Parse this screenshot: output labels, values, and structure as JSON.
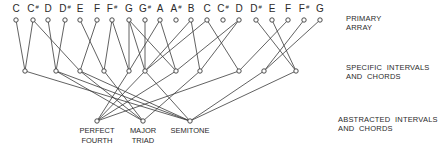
{
  "rows": {
    "primary": {
      "label": "PRIMARY\nARRAY"
    },
    "specific": {
      "label": "SPECIFIC  INTERVALS\nAND  CHORDS"
    },
    "abstracted": {
      "label": "ABSTRACTED  INTERVALS\nAND  CHORDS"
    }
  },
  "primary_notes": [
    {
      "name": "C",
      "accidental": "",
      "x": 16
    },
    {
      "name": "C",
      "accidental": "#",
      "x": 33
    },
    {
      "name": "D",
      "accidental": "",
      "x": 48
    },
    {
      "name": "D",
      "accidental": "#",
      "x": 65
    },
    {
      "name": "E",
      "accidental": "",
      "x": 80
    },
    {
      "name": "F",
      "accidental": "",
      "x": 97
    },
    {
      "name": "F",
      "accidental": "#",
      "x": 112
    },
    {
      "name": "G",
      "accidental": "",
      "x": 129
    },
    {
      "name": "G",
      "accidental": "#",
      "x": 145
    },
    {
      "name": "A",
      "accidental": "",
      "x": 160
    },
    {
      "name": "A",
      "accidental": "#",
      "x": 176
    },
    {
      "name": "B",
      "accidental": "",
      "x": 191
    },
    {
      "name": "C",
      "accidental": "",
      "x": 207
    },
    {
      "name": "C",
      "accidental": "#",
      "x": 223
    },
    {
      "name": "D",
      "accidental": "",
      "x": 239
    },
    {
      "name": "D",
      "accidental": "#",
      "x": 256
    },
    {
      "name": "E",
      "accidental": "",
      "x": 272
    },
    {
      "name": "F",
      "accidental": "",
      "x": 288
    },
    {
      "name": "F",
      "accidental": "#",
      "x": 304
    },
    {
      "name": "G",
      "accidental": "",
      "x": 320
    }
  ],
  "specific_nodes_x": [
    25,
    56,
    80,
    104,
    129,
    145,
    176,
    200,
    239,
    264,
    296
  ],
  "abstracted_nodes": [
    {
      "label": "PERFECT\nFOURTH",
      "x": 97
    },
    {
      "label": "MAJOR\nTRIAD",
      "x": 143
    },
    {
      "label": "SEMITONE",
      "x": 190
    }
  ],
  "edges_primary_to_specific": [
    [
      0,
      0
    ],
    [
      1,
      0
    ],
    [
      1,
      2
    ],
    [
      2,
      1
    ],
    [
      3,
      1
    ],
    [
      4,
      3
    ],
    [
      5,
      2
    ],
    [
      6,
      3
    ],
    [
      6,
      4
    ],
    [
      7,
      4
    ],
    [
      7,
      5
    ],
    [
      7,
      6
    ],
    [
      8,
      5
    ],
    [
      9,
      4
    ],
    [
      9,
      6
    ],
    [
      11,
      5
    ],
    [
      11,
      7
    ],
    [
      12,
      5
    ],
    [
      12,
      8
    ],
    [
      14,
      6
    ],
    [
      14,
      7
    ],
    [
      15,
      10
    ],
    [
      16,
      10
    ],
    [
      17,
      8
    ],
    [
      18,
      9
    ],
    [
      19,
      9
    ]
  ],
  "edges_specific_to_abstracted": [
    [
      0,
      2
    ],
    [
      1,
      2
    ],
    [
      2,
      1
    ],
    [
      3,
      1
    ],
    [
      4,
      0
    ],
    [
      5,
      0
    ],
    [
      6,
      0
    ],
    [
      7,
      1
    ],
    [
      8,
      0
    ],
    [
      9,
      2
    ],
    [
      10,
      2
    ],
    [
      2,
      2
    ],
    [
      1,
      1
    ],
    [
      5,
      2
    ]
  ]
}
